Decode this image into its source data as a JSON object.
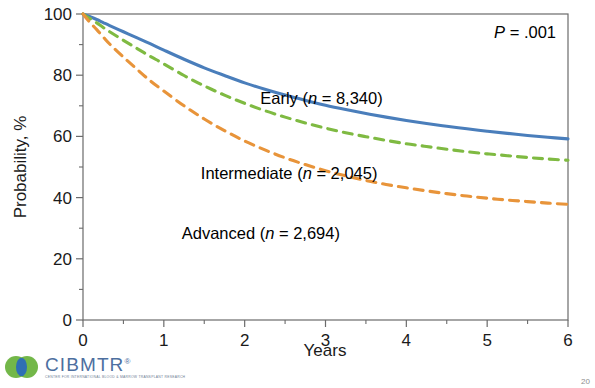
{
  "slide": {
    "page_number": "20",
    "background_color": "#ffffff"
  },
  "logo": {
    "name": "CIBMTR",
    "trademark": "®",
    "tagline": "CENTER FOR INTERNATIONAL BLOOD & MARROW TRANSPLANT RESEARCH",
    "mark_green": "#6cb33f",
    "mark_blue": "#2f6fb5",
    "word_color": "#4d6fa0"
  },
  "chart_data": {
    "type": "line",
    "title": "",
    "xlabel": "Years",
    "ylabel": "Probability, %",
    "xlim": [
      0,
      6
    ],
    "ylim": [
      0,
      100
    ],
    "x_ticks": [
      "0",
      "1",
      "2",
      "3",
      "4",
      "5",
      "6"
    ],
    "x_tick_values": [
      0,
      1,
      2,
      3,
      4,
      5,
      6
    ],
    "x_minor_step": 0.5,
    "y_ticks": [
      "0",
      "20",
      "40",
      "60",
      "80",
      "100"
    ],
    "y_tick_values": [
      0,
      20,
      40,
      60,
      80,
      100
    ],
    "y_minor_step": 10,
    "grid": false,
    "legend_position": "inline-annotations",
    "annotations": [
      {
        "name": "p-value",
        "prefix_italic": "P",
        "text": " = .001",
        "x": 5.45,
        "y": 97
      }
    ],
    "x": [
      0,
      0.08,
      0.17,
      0.25,
      0.33,
      0.5,
      0.67,
      0.83,
      1,
      1.25,
      1.5,
      1.75,
      2,
      2.25,
      2.5,
      2.75,
      3,
      3.25,
      3.5,
      3.75,
      4,
      4.25,
      4.5,
      4.75,
      5,
      5.25,
      5.5,
      5.75,
      6
    ],
    "series": [
      {
        "name": "Early",
        "label": "Early (n = 8,340)",
        "label_prefix": "Early (",
        "label_italic": "n",
        "label_suffix": " = 8,340)",
        "n": "8,340",
        "color": "#4a7ebb",
        "style": "solid",
        "label_x": 2.95,
        "label_y": 70.5,
        "values": [
          100,
          99.2,
          98.2,
          97.2,
          96.2,
          94.2,
          92.2,
          90.3,
          88.2,
          85.2,
          82.4,
          79.9,
          77.5,
          75.4,
          73.5,
          71.8,
          70.2,
          68.8,
          67.5,
          66.3,
          65.2,
          64.2,
          63.3,
          62.5,
          61.7,
          61.0,
          60.3,
          59.7,
          59.2
        ]
      },
      {
        "name": "Intermediate",
        "label": "Intermediate (n = 2,045)",
        "label_prefix": "Intermediate (",
        "label_italic": "n",
        "label_suffix": " = 2,045)",
        "n": "2,045",
        "color": "#7fba42",
        "style": "dashed",
        "label_x": 2.55,
        "label_y": 46,
        "values": [
          100,
          98.6,
          97.1,
          95.6,
          94.2,
          91.4,
          88.7,
          86.2,
          83.7,
          79.9,
          76.5,
          73.5,
          70.8,
          68.4,
          66.3,
          64.4,
          62.7,
          61.2,
          59.9,
          58.7,
          57.6,
          56.7,
          55.8,
          55.0,
          54.3,
          53.7,
          53.1,
          52.6,
          52.2
        ]
      },
      {
        "name": "Advanced",
        "label": "Advanced (n = 2,694)",
        "label_prefix": "Advanced (",
        "label_italic": "n",
        "label_suffix": " = 2,694)",
        "n": "2,694",
        "color": "#e8943a",
        "style": "dashed",
        "label_x": 2.2,
        "label_y": 26.5,
        "values": [
          100,
          97.4,
          94.9,
          92.5,
          90.2,
          85.9,
          81.9,
          78.2,
          74.8,
          70.0,
          65.7,
          61.9,
          58.5,
          55.6,
          53.0,
          50.8,
          48.8,
          47.1,
          45.6,
          44.3,
          43.2,
          42.2,
          41.3,
          40.5,
          39.8,
          39.2,
          38.7,
          38.2,
          37.8
        ]
      }
    ],
    "axis_color": "#6b6b6b",
    "plot_rect": {
      "left": 83,
      "top": 14,
      "right": 568,
      "bottom": 320
    }
  }
}
